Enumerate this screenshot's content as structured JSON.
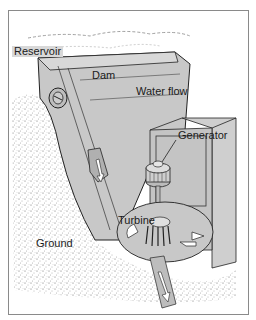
{
  "diagram": {
    "type": "hydroelectric-dam-cross-section",
    "labels": {
      "reservoir": "Reservoir",
      "dam": "Dam",
      "water_flow": "Water flow",
      "generator": "Generator",
      "turbine": "Turbine",
      "ground": "Ground"
    },
    "colors": {
      "structure_fill": "#c8c8c8",
      "structure_dark": "#b4b4b4",
      "outline": "#222222",
      "ground_speckle": "#555555",
      "frame": "#8a8a8a"
    }
  }
}
